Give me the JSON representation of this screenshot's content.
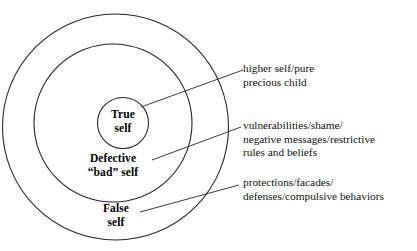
{
  "diagram": {
    "type": "concentric-circles",
    "stroke_color": "#262626",
    "background_color": "#ffffff",
    "rings": [
      {
        "id": "inner",
        "name": "true-self",
        "label_lines": [
          "True",
          "self"
        ],
        "annotation_lines": [
          "higher self/pure",
          "precious child"
        ]
      },
      {
        "id": "middle",
        "name": "defective-bad-self",
        "label_lines": [
          "Defective",
          "“bad” self"
        ],
        "annotation_lines": [
          "vulnerabilities/shame/",
          "negative messages/restrictive",
          "rules and beliefs"
        ]
      },
      {
        "id": "outer",
        "name": "false-self",
        "label_lines": [
          "False",
          "self"
        ],
        "annotation_lines": [
          "protections/facades/",
          "defenses/compulsive behaviors"
        ]
      }
    ]
  }
}
